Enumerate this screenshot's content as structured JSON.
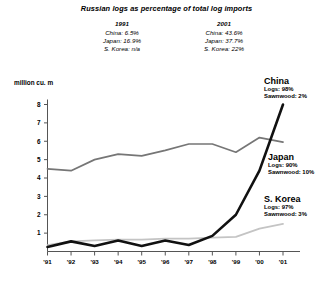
{
  "header": {
    "title": "Russian logs as percentage of total log imports",
    "stat_columns": [
      {
        "year": "1991",
        "rows": [
          "China: 6.5%",
          "Japan: 16.9%",
          "S. Korea: n/a"
        ]
      },
      {
        "year": "2001",
        "rows": [
          "China: 43.6%",
          "Japan: 37.7%",
          "S. Korea: 22%"
        ]
      }
    ]
  },
  "annotations": [
    {
      "name": "China",
      "lines": [
        "Logs: 98%",
        "Sawnwood: 2%"
      ]
    },
    {
      "name": "Japan",
      "lines": [
        "Logs: 90%",
        "Sawnwood: 10%"
      ]
    },
    {
      "name": "S. Korea",
      "lines": [
        "Logs: 97%",
        "Sawnwood: 3%"
      ]
    }
  ],
  "chart_data": {
    "type": "line",
    "title": "Russian logs as percentage of total log imports",
    "xlabel": "",
    "ylabel": "million cu. m",
    "ylim": [
      0,
      8
    ],
    "yticks": [
      1,
      2,
      3,
      4,
      5,
      6,
      7,
      8
    ],
    "grid": false,
    "legend_position": "right-inline",
    "x": [
      "'91",
      "'92",
      "'93",
      "'94",
      "'95",
      "'96",
      "'97",
      "'98",
      "'99",
      "'00",
      "'01"
    ],
    "series": [
      {
        "name": "China",
        "color": "#111111",
        "values": [
          0.25,
          0.55,
          0.3,
          0.6,
          0.3,
          0.6,
          0.35,
          0.85,
          2.0,
          4.4,
          8.0
        ]
      },
      {
        "name": "Japan",
        "color": "#767676",
        "values": [
          4.5,
          4.4,
          5.0,
          5.3,
          5.2,
          5.5,
          5.85,
          5.85,
          5.4,
          6.2,
          5.95
        ]
      },
      {
        "name": "S. Korea",
        "color": "#c4c4c4",
        "values": [
          0.35,
          0.55,
          0.6,
          0.65,
          0.65,
          0.7,
          0.7,
          0.75,
          0.8,
          1.25,
          1.5
        ]
      }
    ]
  }
}
